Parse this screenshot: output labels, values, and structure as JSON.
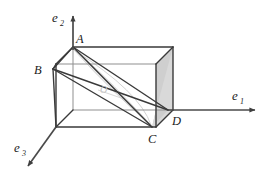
{
  "figure": {
    "background_color": "#ffffff",
    "edge_color": "#3a3a3a",
    "light_edge_color": "#7d7d7d",
    "shade_color": "#d6d6d6",
    "ghost_color": "#cfcfcf",
    "label_color": "#222222"
  },
  "axes": [
    {
      "id": "e1",
      "name": "x-axis",
      "label_base": "e",
      "label_sub": "1",
      "label_x": 232,
      "label_y": 100,
      "sub_x": 240,
      "sub_y": 104,
      "start": [
        168,
        110
      ],
      "end": [
        259,
        110
      ],
      "direction": "right"
    },
    {
      "id": "e2",
      "name": "y-axis",
      "label_base": "e",
      "label_sub": "2",
      "label_x": 52,
      "label_y": 22,
      "sub_x": 60,
      "sub_y": 26,
      "start": [
        73,
        47
      ],
      "end": [
        73,
        12
      ],
      "direction": "up"
    },
    {
      "id": "e3",
      "name": "z-axis",
      "label_base": "e",
      "label_sub": "3",
      "label_x": 14,
      "label_y": 152,
      "sub_x": 22,
      "sub_y": 156,
      "start": [
        68,
        127
      ],
      "end": [
        25,
        170
      ],
      "direction": "down-left"
    }
  ],
  "vertices": [
    {
      "id": "A",
      "label": "A",
      "point": [
        73,
        47
      ],
      "label_x": 76,
      "label_y": 43
    },
    {
      "id": "B",
      "label": "B",
      "point": [
        51,
        70
      ],
      "label_x": 35,
      "label_y": 74
    },
    {
      "id": "C",
      "label": "C",
      "point": [
        152,
        127
      ],
      "label_x": 149,
      "label_y": 142
    },
    {
      "id": "D",
      "label": "D",
      "point": [
        168,
        110
      ],
      "label_x": 172,
      "label_y": 124
    },
    {
      "id": "O",
      "label": "O",
      "point": [
        104,
        89
      ],
      "label_x": 100,
      "label_y": 93
    }
  ],
  "box": {
    "back_face": [
      [
        73,
        47
      ],
      [
        173,
        47
      ],
      [
        173,
        110
      ],
      [
        73,
        110
      ]
    ],
    "front_face": [
      [
        56,
        64
      ],
      [
        156,
        64
      ],
      [
        156,
        127
      ],
      [
        56,
        127
      ]
    ],
    "depth_offset": [
      -17,
      17
    ]
  },
  "diagonals": [
    {
      "id": "AD",
      "from": "A",
      "to": "D",
      "style": "solid-dark"
    },
    {
      "id": "AC",
      "from": "A",
      "to": "C",
      "style": "solid-dark"
    },
    {
      "id": "BD",
      "from": "B",
      "to": "D",
      "style": "solid-dark"
    },
    {
      "id": "BC",
      "from": "B",
      "to": "C",
      "style": "solid-dark"
    }
  ],
  "shaded_regions": [
    {
      "id": "right-face-triangle",
      "name": "right-side-shaded-triangle",
      "color": "#d6d6d6"
    },
    {
      "id": "bottom-corner-triangle",
      "name": "bottom-corner-shaded-triangle",
      "color": "#d6d6d6"
    }
  ],
  "ghost_shape": {
    "id": "diagonal-lens",
    "name": "faded-diagonal-plane",
    "color": "#cfcfcf"
  }
}
